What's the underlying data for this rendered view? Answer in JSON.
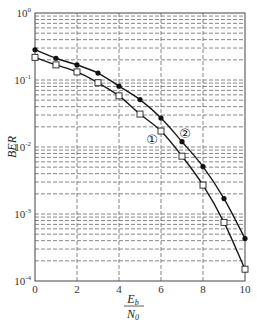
{
  "chart_data": {
    "type": "line",
    "title": "",
    "xlabel": "Eb/N0",
    "xlabel_num": "E",
    "xlabel_num_sub": "b",
    "xlabel_den": "N",
    "xlabel_den_sub": "0",
    "ylabel": "BER",
    "xlim": [
      0,
      10
    ],
    "ylim": [
      0.0001,
      1
    ],
    "yscale": "log",
    "grid": true,
    "x_ticks": [
      0,
      2,
      4,
      6,
      8,
      10
    ],
    "x_tick_labels": [
      "0",
      "2",
      "4",
      "6",
      "8",
      "10"
    ],
    "y_ticks": [
      1,
      0.1,
      0.01,
      0.001,
      0.0001
    ],
    "y_tick_labels": [
      {
        "base": "10",
        "exp": "0"
      },
      {
        "base": "10",
        "exp": "-1"
      },
      {
        "base": "10",
        "exp": "-2"
      },
      {
        "base": "10",
        "exp": "-3"
      },
      {
        "base": "10",
        "exp": "-4"
      }
    ],
    "x": [
      0,
      1,
      2,
      3,
      4,
      5,
      6,
      7,
      8,
      9,
      10
    ],
    "series": [
      {
        "name": "①",
        "marker": "square",
        "label_pos": [
          152,
          139
        ],
        "values": [
          0.218,
          0.168,
          0.132,
          0.091,
          0.058,
          0.031,
          0.0173,
          0.0073,
          0.0027,
          0.00075,
          0.00015
        ]
      },
      {
        "name": "②",
        "marker": "circle-filled",
        "label_pos": [
          185,
          133
        ],
        "values": [
          0.283,
          0.211,
          0.168,
          0.127,
          0.081,
          0.051,
          0.027,
          0.012,
          0.0051,
          0.0017,
          0.00043
        ]
      }
    ],
    "legend": "inline curve labels ① and ②"
  }
}
